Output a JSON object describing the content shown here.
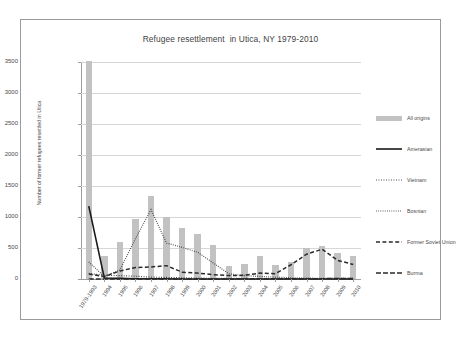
{
  "chart_data": {
    "type": "bar",
    "title": "Refugee resettlement  in Utica, NY 1979-2010",
    "xlabel": "",
    "ylabel": "Number of former refugees resettled in Utica",
    "ylim": [
      0,
      3500
    ],
    "yticks": [
      0,
      500,
      1000,
      1500,
      2000,
      2500,
      3000,
      3500
    ],
    "ytick_labels": [
      "0",
      "500",
      "1000",
      "1500",
      "2000",
      "2500",
      "3000",
      "3500"
    ],
    "grid": true,
    "legend_position": "right",
    "categories": [
      "1979-1993",
      "1994",
      "1995",
      "1996",
      "1997",
      "1998",
      "1999",
      "2000",
      "2001",
      "2002",
      "2003",
      "2004",
      "2005",
      "2006",
      "2007",
      "2008",
      "2009",
      "2010"
    ],
    "bar_series": {
      "name": "All origins",
      "color": "#c2c2c2",
      "values": [
        3510,
        375,
        590,
        960,
        1345,
        1005,
        830,
        725,
        550,
        215,
        240,
        370,
        225,
        280,
        500,
        535,
        420,
        370
      ]
    },
    "series": [
      {
        "name": "Amerasian",
        "style": "solid",
        "color": "#1a1a1a",
        "values": [
          1175,
          15,
          10,
          5,
          5,
          5,
          0,
          0,
          0,
          0,
          0,
          0,
          0,
          0,
          0,
          0,
          0,
          0
        ]
      },
      {
        "name": "Vietnam",
        "style": "dotted",
        "color": "#3a3a3a",
        "values": [
          90,
          60,
          55,
          45,
          30,
          25,
          20,
          15,
          10,
          10,
          10,
          5,
          5,
          5,
          5,
          5,
          5,
          5
        ]
      },
      {
        "name": "Bosnian",
        "style": "dotted-fine",
        "color": "#3a3a3a",
        "values": [
          275,
          40,
          145,
          650,
          1120,
          580,
          510,
          430,
          260,
          85,
          55,
          40,
          30,
          20,
          15,
          10,
          10,
          10
        ]
      },
      {
        "name": "Former Soviet Union",
        "style": "dashed",
        "color": "#2a2a2a",
        "values": [
          80,
          40,
          130,
          185,
          195,
          215,
          110,
          95,
          70,
          55,
          60,
          95,
          85,
          230,
          400,
          480,
          300,
          235
        ]
      },
      {
        "name": "Burma",
        "style": "dash-dot",
        "color": "#2a2a2a",
        "values": [
          0,
          0,
          0,
          0,
          0,
          0,
          0,
          0,
          0,
          0,
          5,
          5,
          5,
          5,
          5,
          5,
          10,
          10
        ]
      }
    ]
  }
}
